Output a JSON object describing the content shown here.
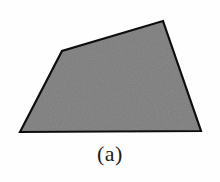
{
  "figure": {
    "caption": "(a)",
    "background_color": "#fefefe",
    "shape": {
      "name": "quadrilateral",
      "fill_color": "#8a8a8a",
      "fill_texture": "noisy-gray-stipple",
      "stroke_color": "#111111",
      "stroke_width": 2.2,
      "vertices": [
        {
          "label": "bottom-left",
          "x": 20,
          "y": 132
        },
        {
          "label": "upper-left",
          "x": 62,
          "y": 51
        },
        {
          "label": "top-right",
          "x": 163,
          "y": 21
        },
        {
          "label": "bottom-right",
          "x": 201,
          "y": 131
        }
      ],
      "points_attr": "20,132 62,51 163,21 201,131"
    }
  }
}
